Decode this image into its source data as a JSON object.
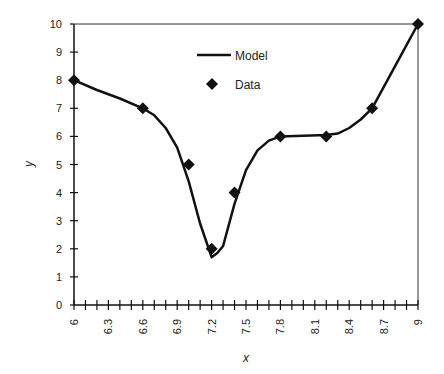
{
  "chart_data": {
    "type": "scatter",
    "title": "",
    "xlabel": "x",
    "ylabel": "y",
    "xlim": [
      6,
      9
    ],
    "ylim": [
      0,
      10
    ],
    "x_ticks": [
      "6",
      "6.3",
      "6.6",
      "6.9",
      "7.2",
      "7.5",
      "7.8",
      "8.1",
      "8.4",
      "8.7",
      "9"
    ],
    "x_tick_values": [
      6,
      6.3,
      6.6,
      6.9,
      7.2,
      7.5,
      7.8,
      8.1,
      8.4,
      8.7,
      9
    ],
    "x_minor_step": 0.1,
    "y_ticks": [
      "0",
      "1",
      "2",
      "3",
      "4",
      "5",
      "6",
      "7",
      "8",
      "9",
      "10"
    ],
    "y_tick_values": [
      0,
      1,
      2,
      3,
      4,
      5,
      6,
      7,
      8,
      9,
      10
    ],
    "grid": false,
    "legend_position": "upper-center",
    "legend": [
      "Model",
      "Data"
    ],
    "series": [
      {
        "name": "Model",
        "style": "line",
        "color": "#111111",
        "x": [
          6.0,
          6.2,
          6.4,
          6.6,
          6.7,
          6.8,
          6.9,
          7.0,
          7.1,
          7.2,
          7.25,
          7.3,
          7.4,
          7.5,
          7.6,
          7.7,
          7.8,
          8.0,
          8.2,
          8.3,
          8.4,
          8.5,
          8.6,
          8.8,
          9.0
        ],
        "y": [
          8.0,
          7.65,
          7.35,
          7.0,
          6.75,
          6.3,
          5.6,
          4.4,
          2.9,
          1.7,
          1.85,
          2.1,
          3.6,
          4.8,
          5.5,
          5.85,
          6.0,
          6.02,
          6.05,
          6.1,
          6.3,
          6.6,
          7.0,
          8.5,
          10.0
        ]
      },
      {
        "name": "Data",
        "style": "marker-diamond",
        "color": "#111111",
        "x": [
          6.0,
          6.6,
          7.0,
          7.2,
          7.4,
          7.8,
          8.2,
          8.6,
          9.0
        ],
        "y": [
          8,
          7,
          5,
          2,
          4,
          6,
          6,
          7,
          10
        ]
      }
    ]
  }
}
